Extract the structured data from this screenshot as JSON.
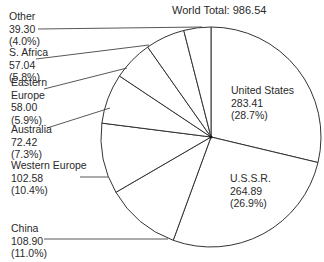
{
  "chart_data": {
    "type": "pie",
    "title": "World Total: 986.54",
    "total": 986.54,
    "start_angle": "12 o'clock, clockwise",
    "slices": [
      {
        "label": "United States",
        "value": 283.41,
        "percent": 28.7,
        "pct_label": "(28.7%)"
      },
      {
        "label": "U.S.S.R.",
        "value": 264.89,
        "percent": 26.9,
        "pct_label": "(26.9%)"
      },
      {
        "label": "China",
        "value": 108.9,
        "percent": 11.0,
        "pct_label": "(11.0%)"
      },
      {
        "label": "Western Europe",
        "value": 102.58,
        "percent": 10.4,
        "pct_label": "(10.4%)"
      },
      {
        "label": "Australia",
        "value": 72.42,
        "percent": 7.3,
        "pct_label": "(7.3%)"
      },
      {
        "label": "Eastern Europe",
        "value": 58.0,
        "percent": 5.9,
        "pct_label": "(5.9%)"
      },
      {
        "label": "S. Africa",
        "value": 57.04,
        "percent": 5.8,
        "pct_label": "(5.8%)"
      },
      {
        "label": "Other",
        "value": 39.3,
        "percent": 4.0,
        "pct_label": "(4.0%)"
      }
    ],
    "colors": {
      "fill": "#ffffff",
      "stroke": "#333333"
    }
  },
  "labels": {
    "us": {
      "name": "United States",
      "value": "283.41",
      "pct": "(28.7%)"
    },
    "ussr": {
      "name": "U.S.S.R.",
      "value": "264.89",
      "pct": "(26.9%)"
    },
    "china": {
      "name": "China",
      "value": "108.90",
      "pct": "(11.0%)"
    },
    "weurope": {
      "name": "Western Europe",
      "value": "102.58",
      "pct": "(10.4%)"
    },
    "australia": {
      "name": "Australia",
      "value": "72.42",
      "pct": "(7.3%)"
    },
    "eeurope": {
      "name1": "Eastern",
      "name2": "Europe",
      "value": "58.00",
      "pct": "(5.9%)"
    },
    "safrica": {
      "name": "S. Africa",
      "value": "57.04",
      "pct": "(5.8%)"
    },
    "other": {
      "name": "Other",
      "value": "39.30",
      "pct": "(4.0%)"
    }
  }
}
